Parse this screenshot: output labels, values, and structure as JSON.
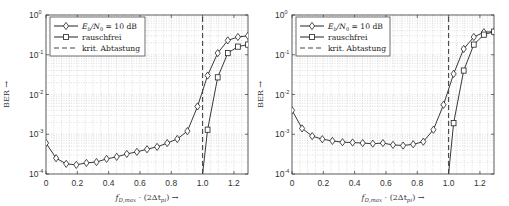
{
  "chart_data": [
    {
      "type": "line",
      "panel": "left",
      "title": "",
      "xlabel": "f_{D,max} · (2Δt_{pi}) →",
      "ylabel": "BER →",
      "xlim": [
        0,
        1.29
      ],
      "ylim": [
        0.0001,
        1
      ],
      "yscale": "log",
      "grid": true,
      "legend_position": "upper left",
      "x_ticks": [
        "0",
        "0.2",
        "0.4",
        "0.6",
        "0.8",
        "1.0",
        "1.2"
      ],
      "y_ticks": [
        "10^0",
        "10^-1",
        "10^-2",
        "10^-3",
        "10^-4"
      ],
      "series": [
        {
          "name": "E_b/N_0 = 10 dB",
          "marker": "diamond",
          "x": [
            0,
            0.0645,
            0.129,
            0.1935,
            0.258,
            0.3225,
            0.387,
            0.4515,
            0.516,
            0.5805,
            0.645,
            0.7095,
            0.774,
            0.8385,
            0.903,
            0.9675,
            1.032,
            1.0965,
            1.161,
            1.2255,
            1.29
          ],
          "values": [
            0.0006,
            0.00025,
            0.00018,
            0.00017,
            0.00019,
            0.0002,
            0.00024,
            0.00027,
            0.00032,
            0.00036,
            0.00042,
            0.00048,
            0.0006,
            0.00076,
            0.0012,
            0.005,
            0.03,
            0.11,
            0.23,
            0.28,
            0.3
          ]
        },
        {
          "name": "rauschfrei",
          "marker": "square",
          "x": [
            1.0,
            1.032,
            1.0965,
            1.161,
            1.2255,
            1.29
          ],
          "values": [
            0.0001,
            0.0013,
            0.027,
            0.11,
            0.16,
            0.18
          ],
          "marker_from_index": 1
        },
        {
          "name": "krit. Abtastung",
          "style": "dashed",
          "x": [
            1.0,
            1.0
          ],
          "values": [
            0.0001,
            1
          ]
        }
      ]
    },
    {
      "type": "line",
      "panel": "right",
      "title": "",
      "xlabel": "f_{D,max} · (2Δt_{pi}) →",
      "ylabel": "BER →",
      "xlim": [
        0,
        1.29
      ],
      "ylim": [
        0.0001,
        1
      ],
      "yscale": "log",
      "grid": true,
      "legend_position": "upper left",
      "x_ticks": [
        "0",
        "0.2",
        "0.4",
        "0.6",
        "0.8",
        "1.0",
        "1.2"
      ],
      "y_ticks": [
        "10^0",
        "10^-1",
        "10^-2",
        "10^-3",
        "10^-4"
      ],
      "series": [
        {
          "name": "E_b/N_0 = 10 dB",
          "marker": "diamond",
          "x": [
            0,
            0.0645,
            0.129,
            0.1935,
            0.258,
            0.3225,
            0.387,
            0.4515,
            0.516,
            0.5805,
            0.645,
            0.7095,
            0.774,
            0.8385,
            0.903,
            0.9675,
            1.032,
            1.0965,
            1.161,
            1.2255,
            1.29
          ],
          "values": [
            0.004,
            0.0014,
            0.0009,
            0.00075,
            0.00068,
            0.00063,
            0.00062,
            0.0006,
            0.00058,
            0.0006,
            0.00054,
            0.00052,
            0.00056,
            0.00065,
            0.0013,
            0.0055,
            0.033,
            0.14,
            0.28,
            0.37,
            0.38
          ]
        },
        {
          "name": "rauschfrei",
          "marker": "square",
          "x": [
            1.0,
            1.032,
            1.0965,
            1.161,
            1.2255,
            1.29
          ],
          "values": [
            0.0001,
            0.0019,
            0.04,
            0.18,
            0.32,
            0.38
          ],
          "marker_from_index": 1
        },
        {
          "name": "krit. Abtastung",
          "style": "dashed",
          "x": [
            1.0,
            1.0
          ],
          "values": [
            0.0001,
            1
          ]
        }
      ]
    }
  ],
  "labels": {
    "ylabel": "BER →",
    "xlabel_main": "f",
    "xlabel_sub": "D,max",
    "xlabel_rest": " · (2Δt",
    "xlabel_sub2": "pi",
    "xlabel_end": ") →",
    "legend": {
      "series1_main": "E",
      "series1_sub": "b",
      "series1_mid": "/N",
      "series1_sub2": "0",
      "series1_end": " = 10 dB",
      "series2": "rauschfrei",
      "series3": "krit. Abtastung"
    },
    "x_ticks": [
      "0",
      "0.2",
      "0.4",
      "0.6",
      "0.8",
      "1.0",
      "1.2"
    ],
    "y_tick_base": "10",
    "y_tick_exps": [
      "0",
      "-1",
      "-2",
      "-3",
      "-4"
    ]
  },
  "colors": {
    "line": "#222222",
    "axis": "#333333",
    "grid": "#c8c8c8",
    "dashed": "#444444",
    "background": "#ffffff"
  }
}
